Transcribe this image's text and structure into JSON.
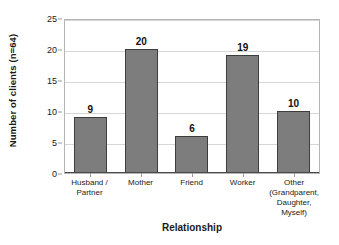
{
  "chart_data": {
    "type": "bar",
    "title": "",
    "subtitle": "",
    "categories": [
      "Husband / Partner",
      "Mother",
      "Friend",
      "Worker",
      "Other (Grandparent, Daughter, Myself)"
    ],
    "category_lines": [
      [
        "Husband /",
        "Partner"
      ],
      [
        "Mother"
      ],
      [
        "Friend"
      ],
      [
        "Worker"
      ],
      [
        "Other",
        "(Grandparent,",
        "Daughter,",
        "Myself)"
      ]
    ],
    "values": [
      9,
      20,
      6,
      19,
      10
    ],
    "value_labels": [
      "9",
      "20",
      "6",
      "19",
      "10"
    ],
    "xlabel": "Relationship",
    "ylabel": "Number of clients (n=64)",
    "ylim": [
      0,
      25
    ],
    "yticks": [
      0,
      5,
      10,
      15,
      20,
      25
    ],
    "ytick_labels": [
      "0",
      "5",
      "10",
      "15",
      "20",
      "25"
    ],
    "grid": true,
    "grid_axis": "y",
    "legend": false,
    "legend_position": "none",
    "bar_color": "#7d7d7d",
    "bar_border_color": "#3d3d3d",
    "grid_color": "#d6d6d6",
    "axis_color": "#4a4a4a",
    "plot_border_color": "#b4b4b4",
    "background_color": "#ffffff",
    "text_color": "#1a1a1a"
  }
}
